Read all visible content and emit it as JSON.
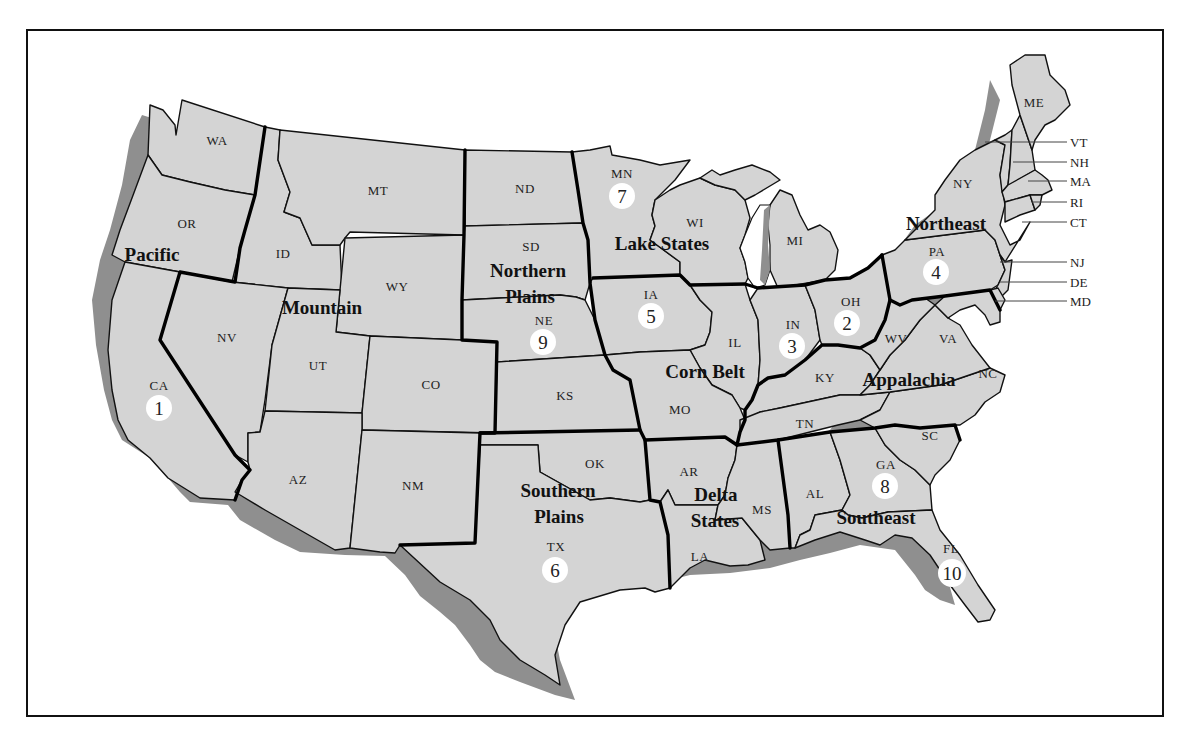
{
  "map": {
    "type": "US farm production regions",
    "colors": {
      "state_fill": "#d4d4d4",
      "shadow": "#8f8f8f",
      "border": "#111111",
      "label_circle": "#ffffff"
    },
    "regions": [
      {
        "name": "Pacific",
        "number": 1,
        "number_state": "CA"
      },
      {
        "name": "Corn Belt",
        "number": 2,
        "number_state": "OH"
      },
      {
        "name": "Corn Belt",
        "number": 3,
        "number_state": "IN"
      },
      {
        "name": "Northeast",
        "number": 4,
        "number_state": "PA"
      },
      {
        "name": "Corn Belt",
        "number": 5,
        "number_state": "IA"
      },
      {
        "name": "Southern Plains",
        "number": 6,
        "number_state": "TX"
      },
      {
        "name": "Lake States",
        "number": 7,
        "number_state": "MN"
      },
      {
        "name": "Southeast",
        "number": 8,
        "number_state": "GA"
      },
      {
        "name": "Northern Plains",
        "number": 9,
        "number_state": "NE"
      },
      {
        "name": "Southeast",
        "number": 10,
        "number_state": "FL"
      }
    ],
    "region_labels": {
      "pacific": "Pacific",
      "mountain": "Mountain",
      "northern_plains_1": "Northern",
      "northern_plains_2": "Plains",
      "lake_states": "Lake States",
      "corn_belt": "Corn Belt",
      "northeast": "Northeast",
      "appalachia": "Appalachia",
      "southern_plains_1": "Southern",
      "southern_plains_2": "Plains",
      "delta_states_1": "Delta",
      "delta_states_2": "States",
      "southeast": "Southeast"
    },
    "state_labels": {
      "WA": "WA",
      "OR": "OR",
      "CA": "CA",
      "ID": "ID",
      "NV": "NV",
      "MT": "MT",
      "WY": "WY",
      "UT": "UT",
      "CO": "CO",
      "AZ": "AZ",
      "NM": "NM",
      "ND": "ND",
      "SD": "SD",
      "NE": "NE",
      "KS": "KS",
      "OK": "OK",
      "TX": "TX",
      "MN": "MN",
      "WI": "WI",
      "MI": "MI",
      "IA": "IA",
      "IL": "IL",
      "IN": "IN",
      "OH": "OH",
      "MO": "MO",
      "KY": "KY",
      "TN": "TN",
      "AR": "AR",
      "LA": "LA",
      "MS": "MS",
      "AL": "AL",
      "GA": "GA",
      "SC": "SC",
      "NC": "NC",
      "VA": "VA",
      "WV": "WV",
      "FL": "FL",
      "PA": "PA",
      "NY": "NY",
      "ME": "ME"
    },
    "callouts": [
      "VT",
      "NH",
      "MA",
      "RI",
      "CT",
      "NJ",
      "DE",
      "MD"
    ],
    "numbers": {
      "n1": "1",
      "n2": "2",
      "n3": "3",
      "n4": "4",
      "n5": "5",
      "n6": "6",
      "n7": "7",
      "n8": "8",
      "n9": "9",
      "n10": "10"
    }
  }
}
